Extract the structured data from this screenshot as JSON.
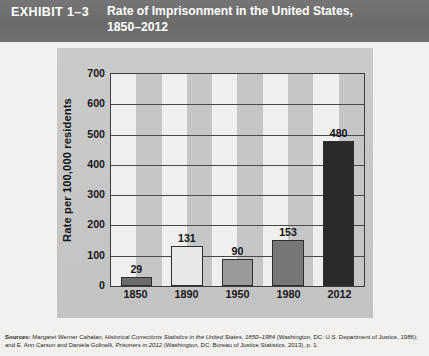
{
  "exhibit": {
    "label": "EXHIBIT 1–3",
    "title": "Rate of Imprisonment in the United States, 1850–2012"
  },
  "chart_data": {
    "type": "bar",
    "title": "Rate of Imprisonment in the United States, 1850–2012",
    "categories": [
      "1850",
      "1890",
      "1950",
      "1980",
      "2012"
    ],
    "values": [
      29,
      131,
      90,
      153,
      480
    ],
    "value_labels": [
      "29",
      "131",
      "90",
      "153",
      "480"
    ],
    "bar_colors": [
      "#6b6b6b",
      "#e8e8e8",
      "#9a9a9a",
      "#777777",
      "#2a2a2a"
    ],
    "xlabel": "",
    "ylabel": "Rate per 100,000 residents",
    "ylim": [
      0,
      700
    ],
    "yticks": [
      700,
      600,
      500,
      400,
      300,
      200,
      100,
      0
    ],
    "ytick_labels": [
      "700",
      "600",
      "500",
      "400",
      "300",
      "200",
      "100",
      "0"
    ],
    "grid": true,
    "legend": false,
    "plot_background": "striped-vertical"
  },
  "source": {
    "label": "Sources:",
    "text_1": " Margaret Werner Cahalan, ",
    "italic_1": "Historical Corrections Statistics in the United States, 1850–1984",
    "text_2": " (Washington, DC: U.S. Department of Justice, 1986); and E. Ann Carson and Daniela Golinelli, ",
    "italic_2": "Prisoners in 2012",
    "text_3": " (Washington, DC: Bureau of Justice Statistics, 2013), p. 1."
  },
  "colors": {
    "banner": "#6d6d6d",
    "panel": "#c9c9c9",
    "stripe_light": "#efefef",
    "stripe_dark": "#c6c6c6",
    "axis": "#3c3c3c"
  }
}
